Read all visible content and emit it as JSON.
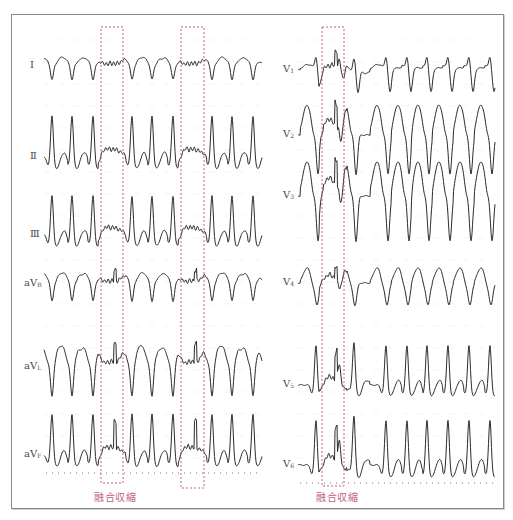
{
  "figure": {
    "colors": {
      "trace": "#2b2b2b",
      "fusion_box": "#c0506a",
      "caption": "#c0607a",
      "baseline_dots": "#777777",
      "frame": "#8a8a8a"
    },
    "left_panel": {
      "leads": [
        {
          "id": "I",
          "label": "Ⅰ",
          "sub": "",
          "y": 66,
          "amp": 14,
          "morph": "negQ"
        },
        {
          "id": "II",
          "label": "Ⅱ",
          "sub": "",
          "y": 157,
          "amp": 44,
          "morph": "tallR"
        },
        {
          "id": "III",
          "label": "Ⅲ",
          "sub": "",
          "y": 235,
          "amp": 42,
          "morph": "tallR"
        },
        {
          "id": "aVR",
          "label": "aV",
          "sub": "R",
          "y": 284,
          "amp": 18,
          "morph": "negQ"
        },
        {
          "id": "aVL",
          "label": "aV",
          "sub": "L",
          "y": 367,
          "amp": 30,
          "morph": "negQbig"
        },
        {
          "id": "aVF",
          "label": "aV",
          "sub": "F",
          "y": 455,
          "amp": 44,
          "morph": "tallR"
        }
      ],
      "label_x": 30,
      "trace_x0": 44,
      "trace_x1": 262,
      "beats_x": [
        52,
        72,
        93,
        132,
        152,
        173,
        212,
        232,
        253
      ],
      "fusion_boxes": [
        {
          "x0": 101,
          "x1": 123,
          "y0": 27,
          "y1": 483
        },
        {
          "x0": 181,
          "x1": 204,
          "y0": 27,
          "y1": 488
        }
      ],
      "caption": {
        "text": "融合収縮",
        "x": 94,
        "y": 489
      }
    },
    "right_panel": {
      "leads": [
        {
          "id": "V1",
          "label": "V",
          "sub": "1",
          "y": 70,
          "amp": 22,
          "morph": "v1"
        },
        {
          "id": "V2",
          "label": "V",
          "sub": "2",
          "y": 135,
          "amp": 40,
          "morph": "deepS"
        },
        {
          "id": "V3",
          "label": "V",
          "sub": "3",
          "y": 196,
          "amp": 46,
          "morph": "deepS"
        },
        {
          "id": "V4",
          "label": "V",
          "sub": "4",
          "y": 283,
          "amp": 22,
          "morph": "deepSsmall"
        },
        {
          "id": "V5",
          "label": "V",
          "sub": "5",
          "y": 385,
          "amp": 42,
          "morph": "tallR"
        },
        {
          "id": "V6",
          "label": "V",
          "sub": "6",
          "y": 465,
          "amp": 48,
          "morph": "tallR"
        }
      ],
      "label_x": 283,
      "trace_x0": 298,
      "trace_x1": 495,
      "beats_x": [
        316,
        339,
        354,
        386,
        407,
        427,
        448,
        469,
        490
      ],
      "fusion_boxes": [
        {
          "x0": 322,
          "x1": 344,
          "y0": 27,
          "y1": 486
        }
      ],
      "caption": {
        "text": "融合収縮",
        "x": 316,
        "y": 489
      }
    }
  }
}
